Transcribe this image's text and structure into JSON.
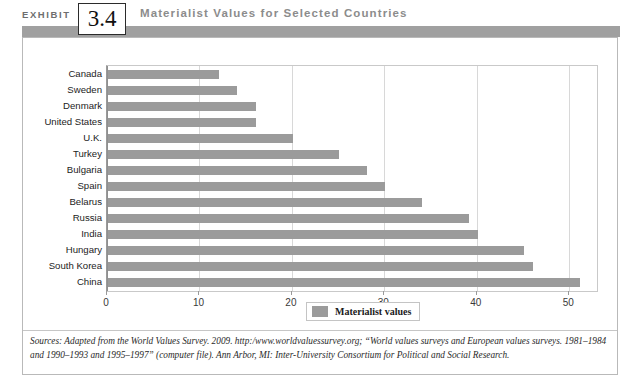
{
  "header": {
    "exhibit_word": "EXHIBIT",
    "exhibit_number": "3.4",
    "title": "Materialist Values for Selected Countries",
    "band_color": "#a0a0a0"
  },
  "legend": {
    "label": "Materialist values",
    "swatch_color": "#9b9b9b"
  },
  "source": {
    "text": "Sources: Adapted from the World Values Survey. 2009. http:/www.worldvaluessurvey.org; “World values surveys and European values surveys. 1981–1984 and 1990–1993 and 1995–1997” (computer file). Ann Arbor, MI: Inter-University Consortium for Political and Social Research."
  },
  "chart_data": {
    "type": "bar",
    "orientation": "horizontal",
    "title": "Materialist Values for Selected Countries",
    "xlabel": "",
    "ylabel": "",
    "xlim": [
      0,
      53
    ],
    "xticks": [
      0,
      10,
      20,
      30,
      40,
      50
    ],
    "xtick_labels": [
      "0",
      "10",
      "20",
      "30",
      "40",
      "50"
    ],
    "grid": true,
    "grid_axis": "x",
    "legend_position": "bottom-center",
    "bar_color": "#9b9b9b",
    "categories": [
      "Canada",
      "Sweden",
      "Denmark",
      "United States",
      "U.K.",
      "Turkey",
      "Bulgaria",
      "Spain",
      "Belarus",
      "Russia",
      "India",
      "Hungary",
      "South Korea",
      "China"
    ],
    "series": [
      {
        "name": "Materialist values",
        "values": [
          12,
          14,
          16,
          16,
          20,
          25,
          28,
          30,
          34,
          39,
          40,
          45,
          46,
          51
        ]
      }
    ]
  }
}
